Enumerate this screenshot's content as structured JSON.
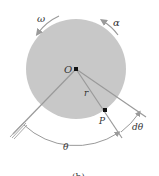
{
  "figure": {
    "labels": {
      "omega": "ω",
      "alpha": "α",
      "origin": "O",
      "radius": "r",
      "point": "P",
      "dtheta": "dθ",
      "theta": "θ",
      "caption": "(b)"
    },
    "colors": {
      "disc_fill": "#c8c8c8",
      "line": "#9a9a9a",
      "text": "#333333",
      "background": "#ffffff"
    }
  }
}
